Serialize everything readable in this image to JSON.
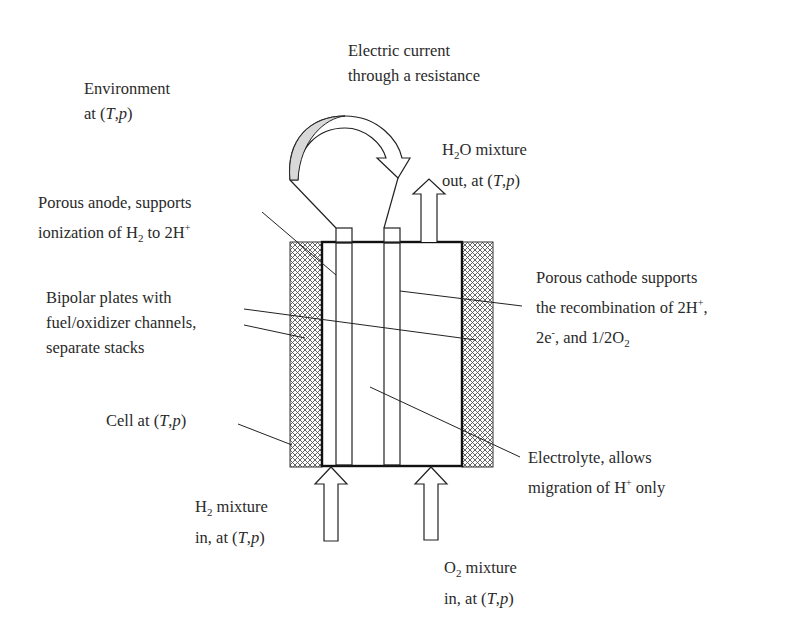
{
  "diagram": {
    "type": "fuel-cell-schematic",
    "colors": {
      "stroke": "#1a1a1a",
      "hatch": "#555555",
      "arrow_shade": "#d8d8d8",
      "text": "#2a2a2a"
    },
    "labels": {
      "environment": {
        "lines": [
          "Environment",
          "at (T,p)"
        ]
      },
      "electric_current": {
        "lines": [
          "Electric current",
          "through a resistance"
        ]
      },
      "h2o_out": {
        "lines": [
          "H2O mixture",
          "out, at (T,p)"
        ]
      },
      "anode": {
        "lines": [
          "Porous anode, supports",
          "ionization of H2 to 2H+"
        ]
      },
      "cathode": {
        "lines": [
          "Porous cathode supports",
          "the recombination of 2H+,",
          "2e-, and 1/2O2"
        ]
      },
      "bipolar": {
        "lines": [
          "Bipolar plates with",
          "fuel/oxidizer channels,",
          "separate stacks"
        ]
      },
      "cell": {
        "lines": [
          "Cell at (T,p)"
        ]
      },
      "electrolyte": {
        "lines": [
          "Electrolyte, allows",
          "migration of H+ only"
        ]
      },
      "h2_in": {
        "lines": [
          "H2 mixture",
          "in, at (T,p)"
        ]
      },
      "o2_in": {
        "lines": [
          "O2 mixture",
          "in, at (T,p)"
        ]
      }
    },
    "components": [
      "environment",
      "external-circuit-arrow",
      "h2o-outlet-arrow",
      "porous-anode",
      "porous-cathode",
      "electrolyte",
      "bipolar-plate-left",
      "bipolar-plate-right",
      "cell-enclosure",
      "h2-inlet-arrow",
      "o2-inlet-arrow"
    ]
  }
}
